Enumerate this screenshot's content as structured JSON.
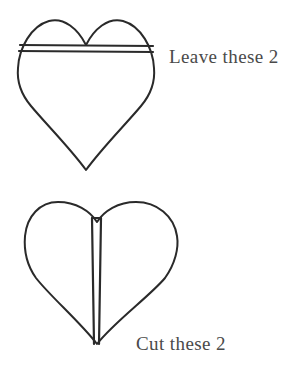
{
  "document": {
    "title": "Heart shape cutting guide",
    "background_color": "#ffffff",
    "ink_color": "#2a2a2a",
    "text_color": "#4a4a4a"
  },
  "figures": [
    {
      "id": "top-heart",
      "name": "heart-with-horizontal-guide-lines",
      "description": "Heart outline crossed by two parallel horizontal lines near the top",
      "guide_lines": {
        "orientation": "horizontal",
        "count": 2
      },
      "caption": "Leave these 2"
    },
    {
      "id": "bottom-heart",
      "name": "heart-with-vertical-guide-lines",
      "description": "Heart outline with two parallel vertical lines down the center",
      "guide_lines": {
        "orientation": "vertical",
        "count": 2
      },
      "caption": "Cut these 2"
    }
  ],
  "captions": {
    "leave": "Leave these 2",
    "cut": "Cut these 2"
  }
}
